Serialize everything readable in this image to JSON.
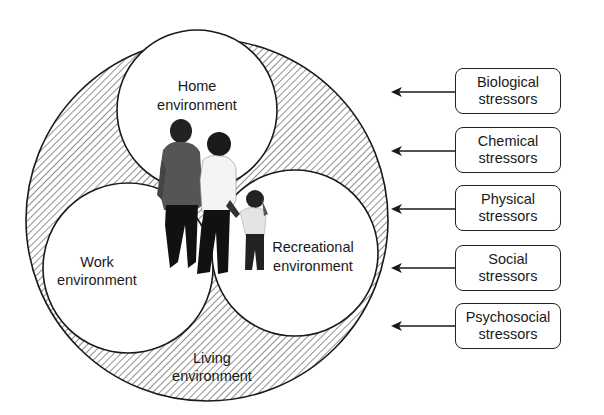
{
  "diagram": {
    "environments": {
      "home": {
        "line1": "Home",
        "line2": "environment"
      },
      "work": {
        "line1": "Work",
        "line2": "environment"
      },
      "recreational": {
        "line1": "Recreational",
        "line2": "environment"
      },
      "living": {
        "line1": "Living",
        "line2": "environment"
      }
    },
    "stressors": [
      {
        "line1": "Biological",
        "line2": "stressors"
      },
      {
        "line1": "Chemical",
        "line2": "stressors"
      },
      {
        "line1": "Physical",
        "line2": "stressors"
      },
      {
        "line1": "Social",
        "line2": "stressors"
      },
      {
        "line1": "Psychosocial",
        "line2": "stressors"
      }
    ],
    "figure": "family-photo (man, woman, child)",
    "colors": {
      "line": "#1a1a1a",
      "hatch": "#333333",
      "background": "#ffffff"
    }
  }
}
